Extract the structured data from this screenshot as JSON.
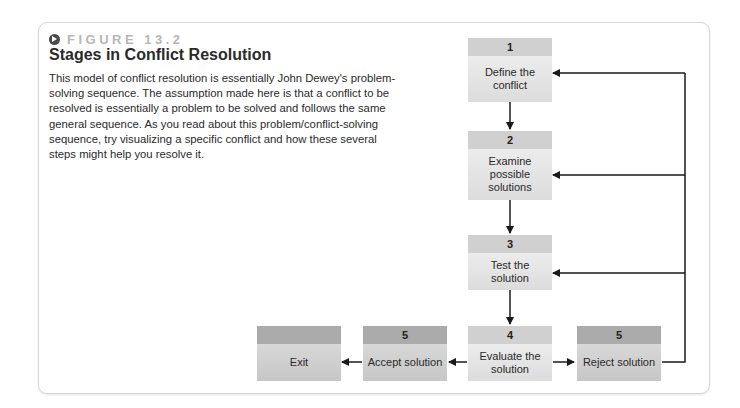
{
  "figure": {
    "label": "FIGURE 13.2",
    "icon": "arrow-right-circle-icon",
    "title": "Stages in Conflict Resolution",
    "caption": "This model of conflict resolution is essentially John Dewey's problem-solving sequence. The assumption made here is that a conflict to be resolved is essentially a problem to be solved and follows the same general sequence. As you read about this problem/conflict-solving sequence, try visualizing a specific conflict and how these several steps might help you resolve it."
  },
  "diagram": {
    "nodes": [
      {
        "id": "define",
        "number": "1",
        "label": "Define the conflict"
      },
      {
        "id": "examine",
        "number": "2",
        "label": "Examine possible solutions"
      },
      {
        "id": "test",
        "number": "3",
        "label": "Test the solution"
      },
      {
        "id": "evaluate",
        "number": "4",
        "label": "Evaluate the solution"
      },
      {
        "id": "reject",
        "number": "5",
        "label": "Reject solution"
      },
      {
        "id": "accept",
        "number": "5",
        "label": "Accept solution"
      },
      {
        "id": "exit",
        "number": "",
        "label": "Exit"
      }
    ],
    "edges": [
      {
        "from": "define",
        "to": "examine"
      },
      {
        "from": "examine",
        "to": "test"
      },
      {
        "from": "test",
        "to": "evaluate"
      },
      {
        "from": "evaluate",
        "to": "reject"
      },
      {
        "from": "evaluate",
        "to": "accept"
      },
      {
        "from": "accept",
        "to": "exit"
      },
      {
        "from": "reject",
        "to": "define"
      },
      {
        "from": "reject",
        "to": "examine"
      },
      {
        "from": "reject",
        "to": "test"
      }
    ],
    "colors": {
      "header_light": "#d0d0d0",
      "header_dark": "#ababab",
      "body_light": "#e4e4e4",
      "body_dark": "#cfcfcf",
      "arrow": "#1a1a1a"
    }
  }
}
